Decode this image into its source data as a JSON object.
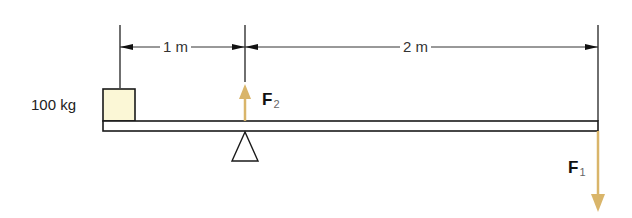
{
  "diagram": {
    "mass_label": "100 kg",
    "dimensions": [
      {
        "label": "1 m"
      },
      {
        "label": "2 m"
      }
    ],
    "forces": [
      {
        "symbol": "F",
        "subscript": "2",
        "direction": "up"
      },
      {
        "symbol": "F",
        "subscript": "1",
        "direction": "down"
      }
    ],
    "colors": {
      "arrow": "#d9b56a",
      "box_fill": "#fbf7d6",
      "line": "#1a1a1a"
    }
  }
}
